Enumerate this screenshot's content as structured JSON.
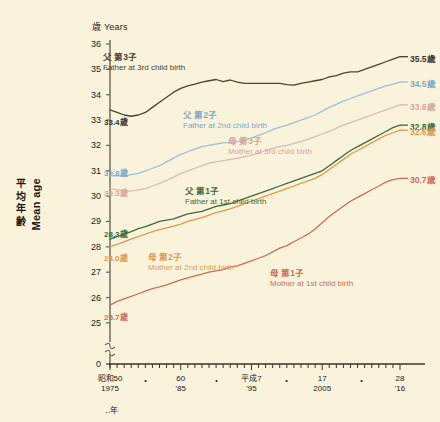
{
  "page": {
    "background_color": "#faf3dc"
  },
  "axis": {
    "unit_label": "歳 Years",
    "ylabel_jp": [
      "平",
      "均",
      "年",
      "齢"
    ],
    "ylabel_en": "Mean age",
    "yticks": [
      "36",
      "35",
      "34",
      "33",
      "32",
      "31",
      "30",
      "29",
      "28",
      "27",
      "26",
      "25",
      "0"
    ],
    "y_break": true,
    "xticks": [
      {
        "l1": "昭和50",
        "l2": "1975"
      },
      {
        "l1": "60",
        "l2": "'85"
      },
      {
        "l1": "平成7",
        "l2": "'95"
      },
      {
        "l1": "17",
        "l2": "2005"
      },
      {
        "l1": "28",
        "l2": "'16"
      }
    ],
    "xdots": [
      "・",
      "・",
      "・",
      "・"
    ],
    "x_unit": "‥年"
  },
  "chart_data": {
    "type": "line",
    "title": "",
    "xlabel": "年 (Year)",
    "ylabel": "平均年齢 Mean age",
    "unit": "歳 Years",
    "ylim": [
      24.6,
      36
    ],
    "xlim": [
      1975,
      2016
    ],
    "grid": false,
    "legend_position": "inline-annotations",
    "x": [
      1975,
      1976,
      1977,
      1978,
      1979,
      1980,
      1981,
      1982,
      1983,
      1984,
      1985,
      1986,
      1987,
      1988,
      1989,
      1990,
      1991,
      1992,
      1993,
      1994,
      1995,
      1996,
      1997,
      1998,
      1999,
      2000,
      2001,
      2002,
      2003,
      2004,
      2005,
      2006,
      2007,
      2008,
      2009,
      2010,
      2011,
      2012,
      2013,
      2014,
      2015,
      2016
    ],
    "series": [
      {
        "name": "父 第3子 Father at 3rd child birth",
        "name_jp": "父 第3子",
        "name_en": "Father at 3rd child birth",
        "color": "#4a4236",
        "start_value": "33.4歳",
        "end_value": "35.5歳",
        "values": [
          33.4,
          33.3,
          33.2,
          33.15,
          33.2,
          33.3,
          33.5,
          33.7,
          33.9,
          34.1,
          34.25,
          34.35,
          34.42,
          34.5,
          34.55,
          34.6,
          34.52,
          34.58,
          34.5,
          34.45,
          34.45,
          34.45,
          34.45,
          34.45,
          34.45,
          34.4,
          34.38,
          34.45,
          34.5,
          34.55,
          34.6,
          34.7,
          34.75,
          34.85,
          34.9,
          34.9,
          35.0,
          35.1,
          35.2,
          35.3,
          35.4,
          35.5
        ]
      },
      {
        "name": "父 第2子 Father at 2nd child birth",
        "name_jp": "父 第2子",
        "name_en": "Father at 2nd child birth",
        "color": "#9cc0d8",
        "start_value": "30.8歳",
        "end_value": "34.5歳",
        "values": [
          30.8,
          30.8,
          30.8,
          30.85,
          30.9,
          31.0,
          31.1,
          31.2,
          31.35,
          31.5,
          31.65,
          31.75,
          31.85,
          31.95,
          32.0,
          32.05,
          32.1,
          32.12,
          32.15,
          32.2,
          32.3,
          32.4,
          32.5,
          32.62,
          32.72,
          32.8,
          32.9,
          33.0,
          33.1,
          33.2,
          33.35,
          33.5,
          33.62,
          33.75,
          33.85,
          33.95,
          34.05,
          34.15,
          34.25,
          34.35,
          34.42,
          34.5
        ]
      },
      {
        "name": "母 第3子 Mother at 3rd child birth",
        "name_jp": "母 第3子",
        "name_en": "Mother at 3rd child birth",
        "color": "#e0b9b0",
        "start_value": "30.3歳",
        "end_value": "33.6歳",
        "values": [
          30.3,
          30.25,
          30.2,
          30.2,
          30.25,
          30.3,
          30.4,
          30.5,
          30.62,
          30.75,
          30.9,
          31.0,
          31.1,
          31.2,
          31.3,
          31.35,
          31.4,
          31.45,
          31.5,
          31.55,
          31.62,
          31.7,
          31.8,
          31.88,
          31.95,
          32.0,
          32.08,
          32.15,
          32.25,
          32.35,
          32.45,
          32.55,
          32.68,
          32.8,
          32.9,
          33.0,
          33.1,
          33.2,
          33.3,
          33.4,
          33.5,
          33.6
        ]
      },
      {
        "name": "父 第1子 Father at 1st child birth",
        "name_jp": "父 第1子",
        "name_en": "Father at 1st child birth",
        "color": "#3e6b3a",
        "start_value": "28.3歳",
        "end_value": "32.8歳",
        "values": [
          28.3,
          28.4,
          28.5,
          28.6,
          28.72,
          28.8,
          28.9,
          29.0,
          29.05,
          29.1,
          29.2,
          29.3,
          29.35,
          29.4,
          29.5,
          29.6,
          29.65,
          29.7,
          29.8,
          29.9,
          30.0,
          30.1,
          30.2,
          30.3,
          30.4,
          30.5,
          30.6,
          30.7,
          30.8,
          30.9,
          31.0,
          31.2,
          31.4,
          31.6,
          31.8,
          31.95,
          32.1,
          32.25,
          32.4,
          32.55,
          32.7,
          32.8
        ]
      },
      {
        "name": "母 第2子 Mother at 2nd child birth",
        "name_jp": "母 第2子",
        "name_en": "Mother at 2nd child birth",
        "color": "#e09a4a",
        "start_value": "28.0歳",
        "end_value": "32.6歳",
        "values": [
          28.0,
          28.1,
          28.2,
          28.3,
          28.4,
          28.5,
          28.6,
          28.68,
          28.75,
          28.82,
          28.9,
          29.0,
          29.08,
          29.15,
          29.25,
          29.35,
          29.42,
          29.5,
          29.6,
          29.7,
          29.8,
          29.9,
          30.0,
          30.1,
          30.2,
          30.3,
          30.4,
          30.5,
          30.6,
          30.7,
          30.85,
          31.05,
          31.25,
          31.45,
          31.65,
          31.8,
          31.95,
          32.1,
          32.25,
          32.4,
          32.5,
          32.6
        ]
      },
      {
        "name": "母 第1子 Mother at 1st child birth",
        "name_jp": "母 第1子",
        "name_en": "Mother at 1st child birth",
        "color": "#c96f5a",
        "start_value": "25.7歳",
        "end_value": "30.7歳",
        "values": [
          25.7,
          25.85,
          25.95,
          26.05,
          26.15,
          26.25,
          26.35,
          26.42,
          26.5,
          26.6,
          26.7,
          26.78,
          26.85,
          26.92,
          27.0,
          27.05,
          27.1,
          27.2,
          27.25,
          27.35,
          27.45,
          27.55,
          27.65,
          27.8,
          27.95,
          28.05,
          28.2,
          28.35,
          28.5,
          28.7,
          28.95,
          29.2,
          29.4,
          29.6,
          29.8,
          29.95,
          30.1,
          30.25,
          30.4,
          30.55,
          30.65,
          30.7
        ]
      }
    ]
  },
  "labels": {
    "left_values": [
      {
        "text": "33.4歳",
        "color": "#3b362c"
      },
      {
        "text": "30.8歳",
        "color": "#7ba9c6"
      },
      {
        "text": "30.3歳",
        "color": "#d6a79d"
      },
      {
        "text": "28.3歳",
        "color": "#3e6b3a"
      },
      {
        "text": "28.0歳",
        "color": "#e09a4a"
      },
      {
        "text": "25.7歳",
        "color": "#c96f5a"
      }
    ],
    "right_values": [
      {
        "text": "35.5歳",
        "color": "#3b362c"
      },
      {
        "text": "34.5歳",
        "color": "#7ba9c6"
      },
      {
        "text": "33.6歳",
        "color": "#d6a79d"
      },
      {
        "text": "32.8歳",
        "color": "#3e6b3a"
      },
      {
        "text": "32.6歳",
        "color": "#e09a4a"
      },
      {
        "text": "30.7歳",
        "color": "#c96f5a"
      }
    ]
  }
}
